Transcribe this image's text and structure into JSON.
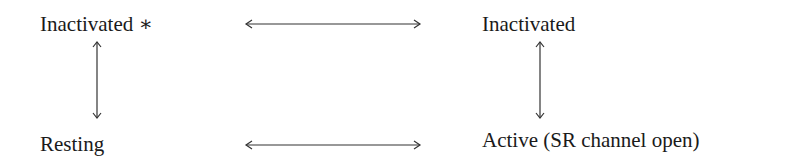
{
  "diagram": {
    "states": {
      "top_left": "Inactivated ∗",
      "top_right": "Inactivated",
      "bottom_left": "Resting",
      "bottom_right": "Active (SR channel open)"
    },
    "transitions": [
      {
        "from": "Inactivated *",
        "to": "Inactivated",
        "type": "bidirectional"
      },
      {
        "from": "Inactivated *",
        "to": "Resting",
        "type": "bidirectional"
      },
      {
        "from": "Inactivated",
        "to": "Active (SR channel open)",
        "type": "bidirectional"
      },
      {
        "from": "Resting",
        "to": "Active (SR channel open)",
        "type": "bidirectional"
      }
    ],
    "colors": {
      "text": "#1a1a1a",
      "arrow": "#333333",
      "background": "#ffffff"
    }
  }
}
